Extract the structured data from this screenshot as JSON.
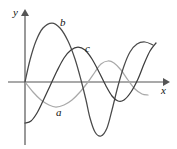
{
  "figure": {
    "kind": "sinusoid-comparison-plot",
    "background_color": "#ffffff",
    "axes": {
      "x_axis_label": "x",
      "y_axis_label": "y",
      "axis_color": "#555555",
      "origin_px": [
        25,
        82
      ],
      "x_axis_arrow_tip_px": [
        167,
        82
      ],
      "y_axis_arrow_tip_px": [
        25,
        11
      ]
    },
    "labels": {
      "a": "a",
      "b": "b",
      "c": "c"
    }
  },
  "chart_data": {
    "type": "line",
    "title": "",
    "subtitle": "",
    "xlabel": "x",
    "ylabel": "y",
    "grid": false,
    "legend": "inline-curve-labels",
    "xlim": [
      0,
      142
    ],
    "ylim": [
      -53,
      59
    ],
    "axis_origin": [
      25,
      82
    ],
    "series": [
      {
        "name": "a",
        "label": "a",
        "color": "#a9a9a9",
        "amplitude_px": 21,
        "wavelength_px": 92,
        "phase": "starts at origin going negative",
        "description": "smallest amplitude sine, negative first half-cycle",
        "points": [
          [
            25,
            82
          ],
          [
            33,
            92
          ],
          [
            41,
            100
          ],
          [
            49,
            105
          ],
          [
            56,
            107
          ],
          [
            64,
            105
          ],
          [
            72,
            100
          ],
          [
            80,
            92
          ],
          [
            88,
            82
          ],
          [
            95,
            72
          ],
          [
            101,
            64
          ],
          [
            108,
            61
          ],
          [
            114,
            63
          ],
          [
            121,
            70
          ],
          [
            128,
            80
          ],
          [
            135,
            89
          ],
          [
            142,
            94
          ],
          [
            148,
            95
          ]
        ]
      },
      {
        "name": "b",
        "label": "b",
        "color": "#4a4a4a",
        "amplitude_px": 59,
        "wavelength_px": 93,
        "phase": "starts at origin going positive",
        "description": "largest amplitude sine, positive first half-cycle",
        "points": [
          [
            25,
            82
          ],
          [
            30,
            60
          ],
          [
            36,
            41
          ],
          [
            43,
            28
          ],
          [
            52,
            23
          ],
          [
            60,
            28
          ],
          [
            68,
            41
          ],
          [
            75,
            59
          ],
          [
            81,
            80
          ],
          [
            86,
            100
          ],
          [
            90,
            118
          ],
          [
            95,
            132
          ],
          [
            101,
            136
          ],
          [
            107,
            128
          ],
          [
            112,
            110
          ],
          [
            118,
            86
          ],
          [
            124,
            66
          ],
          [
            130,
            52
          ],
          [
            137,
            44
          ],
          [
            145,
            42
          ],
          [
            153,
            45
          ]
        ]
      },
      {
        "name": "c",
        "label": "c",
        "color": "#3d3d3d",
        "amplitude_px": 41,
        "wavelength_px": 117,
        "phase": "starts below axis, rising",
        "description": "medium amplitude sine, begins at negative minimum",
        "points": [
          [
            25,
            123
          ],
          [
            31,
            121
          ],
          [
            37,
            113
          ],
          [
            43,
            101
          ],
          [
            50,
            86
          ],
          [
            57,
            71
          ],
          [
            64,
            58
          ],
          [
            71,
            50
          ],
          [
            78,
            47
          ],
          [
            85,
            50
          ],
          [
            92,
            59
          ],
          [
            99,
            72
          ],
          [
            106,
            86
          ],
          [
            112,
            96
          ],
          [
            118,
            101
          ],
          [
            124,
            100
          ],
          [
            131,
            92
          ],
          [
            138,
            79
          ],
          [
            144,
            64
          ],
          [
            150,
            51
          ],
          [
            156,
            43
          ]
        ]
      }
    ]
  }
}
